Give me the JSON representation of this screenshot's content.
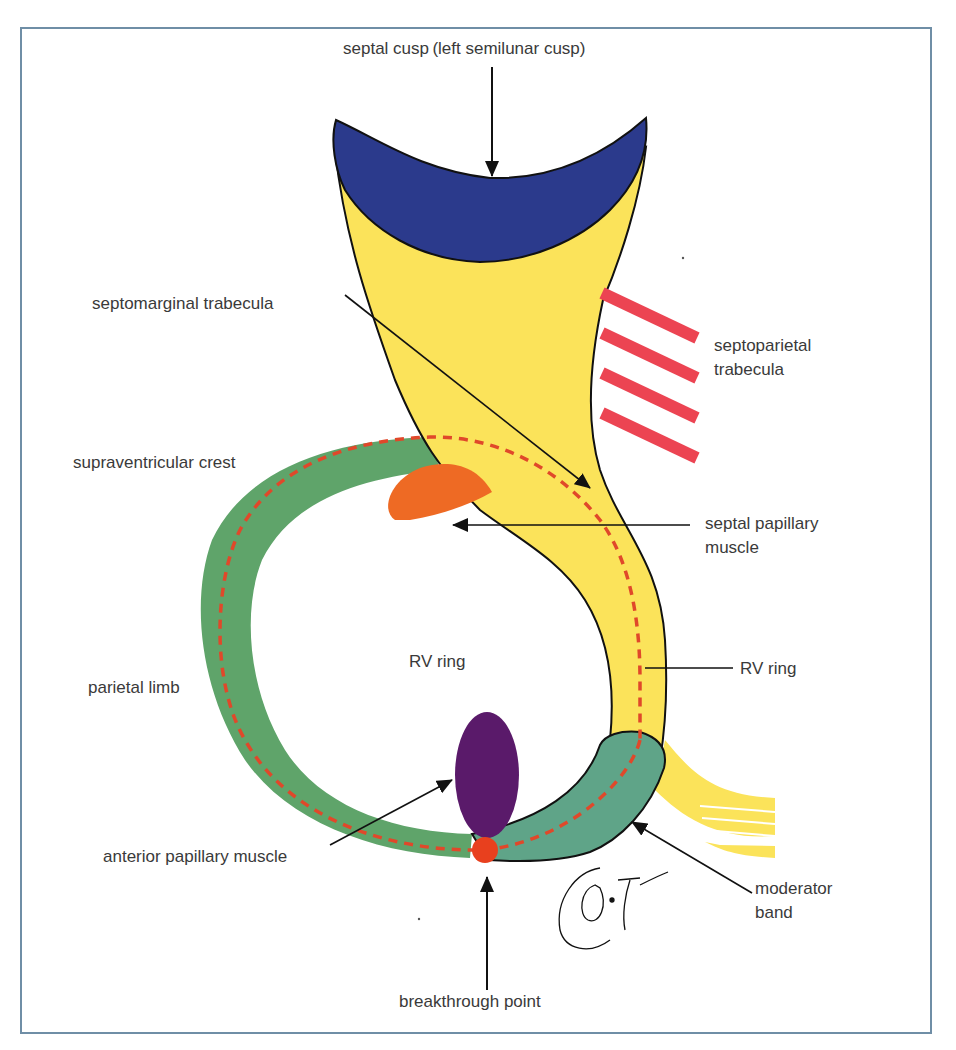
{
  "figure": {
    "type": "anatomical schematic",
    "border_color": "#6f8ea6"
  },
  "labels": {
    "septal_cusp": "septal cusp (left semilunar cusp)",
    "septomarginal_trabecula": "septomarginal trabecula",
    "septoparietal_trabecula_line1": "septoparietal",
    "septoparietal_trabecula_line2": "trabecula",
    "supraventricular_crest": "supraventricular crest",
    "septal_papillary_muscle_line1": "septal papillary",
    "septal_papillary_muscle_line2": "muscle",
    "rv_ring_center": "RV ring",
    "rv_ring_right": "RV ring",
    "parietal_limb": "parietal limb",
    "anterior_papillary_muscle": "anterior papillary muscle",
    "moderator_band_line1": "moderator",
    "moderator_band_line2": "band",
    "breakthrough_point": "breakthrough point",
    "signature": "O. Igawa"
  },
  "colors": {
    "septal_cusp": "#2b3a8c",
    "septomarginal_trabecula": "#fbe35a",
    "septoparietal_trabecula": "#ec4452",
    "supraventricular_crest": "#5fa46a",
    "moderator_band": "#5fa488",
    "septal_papillary_muscle": "#ee6a24",
    "anterior_papillary_muscle": "#5a1a6a",
    "breakthrough_point": "#e8401e",
    "rv_ring_dashed": "#e0482a",
    "outline": "#111111",
    "leader_line": "#111111",
    "text": "#3a3a3a"
  }
}
